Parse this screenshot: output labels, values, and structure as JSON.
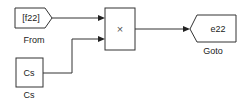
{
  "diagram": {
    "blocks": [
      {
        "id": "from",
        "type": "From",
        "content": "[f22]",
        "label": "From"
      },
      {
        "id": "cs",
        "type": "Constant",
        "content": "Cs",
        "label": "Cs"
      },
      {
        "id": "product",
        "type": "Product",
        "content": "×",
        "label": ""
      },
      {
        "id": "goto",
        "type": "Goto",
        "content": "e22",
        "label": "Goto"
      }
    ],
    "connections": [
      {
        "from": "from",
        "to": "product",
        "port": 1
      },
      {
        "from": "cs",
        "to": "product",
        "port": 2
      },
      {
        "from": "product",
        "to": "goto",
        "port": 1
      }
    ],
    "colors": {
      "line": "#333333",
      "block_border": "#333333",
      "background": "#ffffff"
    }
  }
}
